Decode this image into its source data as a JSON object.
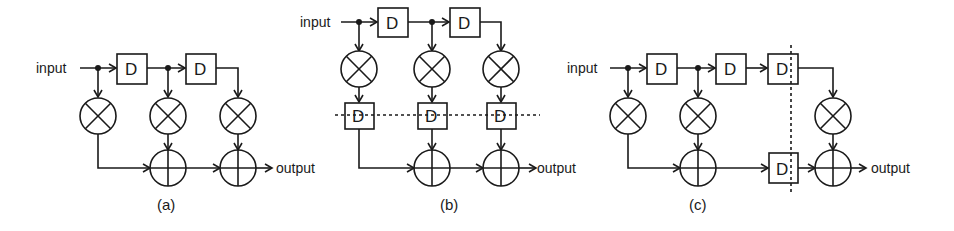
{
  "diagram": {
    "type": "FIR filter structures (direct form, pipelined, retimed)",
    "panels": [
      {
        "id": "a",
        "caption": "(a)",
        "input_label": "input",
        "output_label": "output",
        "delay_label": "D",
        "delays": 2,
        "multipliers": 3,
        "adders": 2
      },
      {
        "id": "b",
        "caption": "(b)",
        "input_label": "input",
        "output_label": "output",
        "delay_label": "D",
        "delays": 5,
        "multipliers": 3,
        "adders": 2,
        "cutset": "horizontal dashed line through pipeline registers"
      },
      {
        "id": "c",
        "caption": "(c)",
        "input_label": "input",
        "output_label": "output",
        "delay_label": "D",
        "delays": 4,
        "multipliers": 3,
        "adders": 2,
        "cutset": "vertical dashed line through delay registers"
      }
    ],
    "symbols": {
      "multiplier": "circle-times",
      "adder": "circle-plus",
      "delay": "box-D",
      "junction": "filled-dot"
    },
    "colors": {
      "stroke": "#1a1a1a",
      "background": "#ffffff"
    }
  }
}
